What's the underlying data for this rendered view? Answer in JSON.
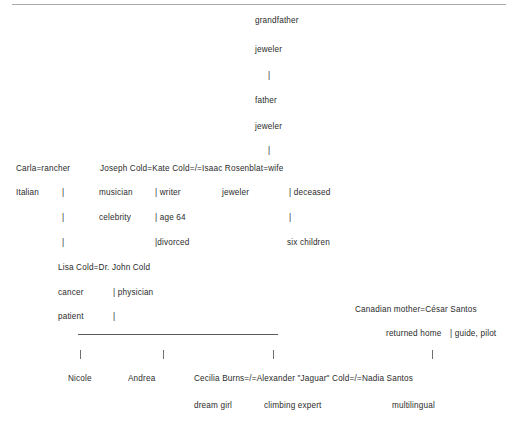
{
  "document": {
    "type": "family-tree-diagram",
    "title": "Cold family genealogy chart",
    "background_color": "#ffffff",
    "text_color": "#2b2b2b",
    "rule_color": "#a9a9a9",
    "connector_color": "#6f6f6f"
  },
  "ancestors": {
    "grandfather_name": "grandfather",
    "grandfather_occupation": "jeweler",
    "link_grandfather_to_father": "|",
    "father_name": "father",
    "father_occupation": "jeweler",
    "link_father_to_children": "|"
  },
  "generation_two": {
    "union_line_left": "Carla=rancher",
    "union_line_right": "Joseph Cold=Kate Cold=/=Isaac Rosenblat=wife",
    "carla_trait": "Italian",
    "carla_tick": "|",
    "joseph_trait_1": "musician",
    "joseph_trait_2": "celebrity",
    "joseph_tick_1": "|",
    "joseph_tick_2": "|",
    "kate_trait_1": "| writer",
    "kate_trait_2": "| age 64",
    "kate_trait_3": "|divorced",
    "isaac_trait": "jeweler",
    "wife_trait_1": "| deceased",
    "wife_trait_2": "|",
    "rosenblat_children": "six children"
  },
  "generation_three": {
    "cold_union": "Lisa Cold=Dr. John Cold",
    "lisa_trait": "cancer",
    "lisa_trait_2": "patient",
    "john_trait": "| physician",
    "john_tick": "|",
    "santos_union": "Canadian mother=César Santos",
    "santos_mother_trait": "returned home",
    "santos_father_trait": "| guide, pilot"
  },
  "generation_four": {
    "ticks": [
      "|",
      "|",
      "|",
      "|"
    ],
    "children": [
      {
        "name": "Nicole",
        "trait": ""
      },
      {
        "name": "Andrea",
        "trait": ""
      }
    ],
    "marriage_line": "Cecilia Burns=/=Alexander \"Jaguar\" Cold=/=Nadia Santos",
    "cecilia_trait": "dream girl",
    "alexander_trait": "climbing expert",
    "nadia_trait": "multilingual"
  }
}
